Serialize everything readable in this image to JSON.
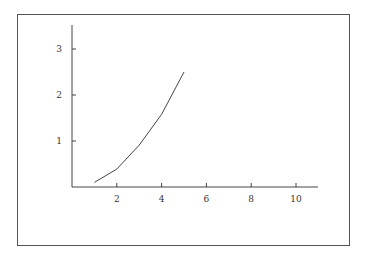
{
  "chart_data": {
    "type": "line",
    "title": "",
    "xlabel": "",
    "ylabel": "",
    "xlim": [
      0,
      11
    ],
    "ylim": [
      0,
      3.5
    ],
    "grid": false,
    "legend": null,
    "x_ticks": [
      2,
      4,
      6,
      8,
      10
    ],
    "y_ticks": [
      1,
      2,
      3
    ],
    "x_tick_labels": [
      "2",
      "4",
      "6",
      "8",
      "10"
    ],
    "y_tick_labels": [
      "1",
      "2",
      "3"
    ],
    "series": [
      {
        "name": "series-1",
        "color": "#444444",
        "x": [
          1,
          2,
          3,
          4,
          5
        ],
        "y": [
          0.1,
          0.39,
          0.91,
          1.58,
          2.5
        ]
      }
    ]
  }
}
